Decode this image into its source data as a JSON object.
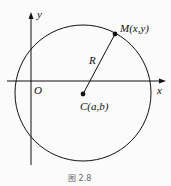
{
  "figure": {
    "caption": "图 2.8",
    "axes": {
      "x_label": "x",
      "y_label": "y",
      "origin_label": "O"
    },
    "circle": {
      "center_label": "C(a,b)",
      "point_label": "M(x,y)",
      "radius_label": "R"
    },
    "colors": {
      "stroke": "#111111",
      "background": "#fbfbfb"
    }
  }
}
